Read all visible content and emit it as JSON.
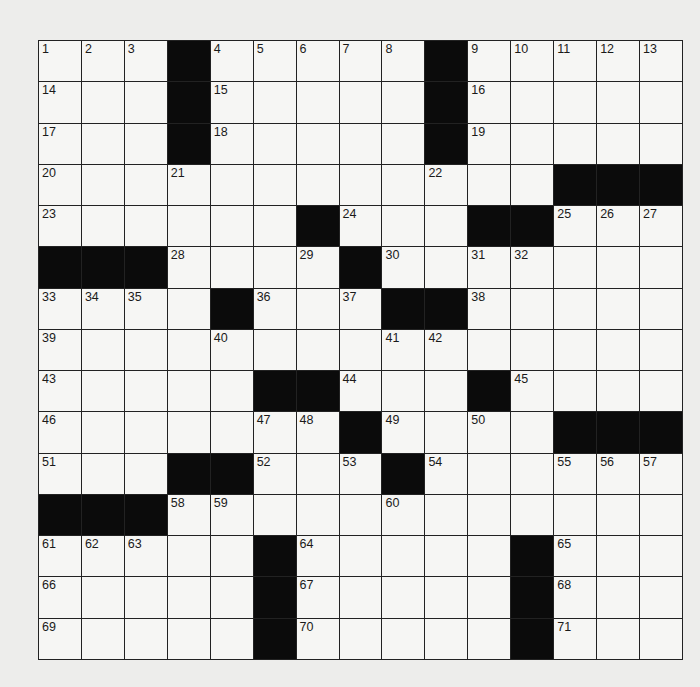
{
  "puzzle": {
    "size": 15,
    "rows": [
      "...#.....#.....",
      "...#.....#.....",
      "...#.....#.....",
      "............###",
      "......#...##...",
      "###....#.......",
      "....#...##.....",
      "...............",
      ".....##...#....",
      ".......#....###",
      "...##...#......",
      "###............",
      ".....#.....#...",
      ".....#.....#...",
      ".....#.....#..."
    ],
    "numbers": [
      {
        "r": 0,
        "c": 0,
        "n": "1"
      },
      {
        "r": 0,
        "c": 1,
        "n": "2"
      },
      {
        "r": 0,
        "c": 2,
        "n": "3"
      },
      {
        "r": 0,
        "c": 4,
        "n": "4"
      },
      {
        "r": 0,
        "c": 5,
        "n": "5"
      },
      {
        "r": 0,
        "c": 6,
        "n": "6"
      },
      {
        "r": 0,
        "c": 7,
        "n": "7"
      },
      {
        "r": 0,
        "c": 8,
        "n": "8"
      },
      {
        "r": 0,
        "c": 10,
        "n": "9"
      },
      {
        "r": 0,
        "c": 11,
        "n": "10"
      },
      {
        "r": 0,
        "c": 12,
        "n": "11"
      },
      {
        "r": 0,
        "c": 13,
        "n": "12"
      },
      {
        "r": 0,
        "c": 14,
        "n": "13"
      },
      {
        "r": 1,
        "c": 0,
        "n": "14"
      },
      {
        "r": 1,
        "c": 4,
        "n": "15"
      },
      {
        "r": 1,
        "c": 10,
        "n": "16"
      },
      {
        "r": 2,
        "c": 0,
        "n": "17"
      },
      {
        "r": 2,
        "c": 4,
        "n": "18"
      },
      {
        "r": 2,
        "c": 10,
        "n": "19"
      },
      {
        "r": 3,
        "c": 0,
        "n": "20"
      },
      {
        "r": 3,
        "c": 3,
        "n": "21"
      },
      {
        "r": 3,
        "c": 9,
        "n": "22"
      },
      {
        "r": 4,
        "c": 0,
        "n": "23"
      },
      {
        "r": 4,
        "c": 7,
        "n": "24"
      },
      {
        "r": 4,
        "c": 12,
        "n": "25"
      },
      {
        "r": 4,
        "c": 13,
        "n": "26"
      },
      {
        "r": 4,
        "c": 14,
        "n": "27"
      },
      {
        "r": 5,
        "c": 3,
        "n": "28"
      },
      {
        "r": 5,
        "c": 6,
        "n": "29"
      },
      {
        "r": 5,
        "c": 8,
        "n": "30"
      },
      {
        "r": 5,
        "c": 10,
        "n": "31"
      },
      {
        "r": 5,
        "c": 11,
        "n": "32"
      },
      {
        "r": 6,
        "c": 0,
        "n": "33"
      },
      {
        "r": 6,
        "c": 1,
        "n": "34"
      },
      {
        "r": 6,
        "c": 2,
        "n": "35"
      },
      {
        "r": 6,
        "c": 5,
        "n": "36"
      },
      {
        "r": 6,
        "c": 7,
        "n": "37"
      },
      {
        "r": 6,
        "c": 10,
        "n": "38"
      },
      {
        "r": 7,
        "c": 0,
        "n": "39"
      },
      {
        "r": 7,
        "c": 4,
        "n": "40"
      },
      {
        "r": 7,
        "c": 8,
        "n": "41"
      },
      {
        "r": 7,
        "c": 9,
        "n": "42"
      },
      {
        "r": 8,
        "c": 0,
        "n": "43"
      },
      {
        "r": 8,
        "c": 7,
        "n": "44"
      },
      {
        "r": 8,
        "c": 11,
        "n": "45"
      },
      {
        "r": 9,
        "c": 0,
        "n": "46"
      },
      {
        "r": 9,
        "c": 5,
        "n": "47"
      },
      {
        "r": 9,
        "c": 6,
        "n": "48"
      },
      {
        "r": 9,
        "c": 8,
        "n": "49"
      },
      {
        "r": 9,
        "c": 10,
        "n": "50"
      },
      {
        "r": 10,
        "c": 0,
        "n": "51"
      },
      {
        "r": 10,
        "c": 5,
        "n": "52"
      },
      {
        "r": 10,
        "c": 7,
        "n": "53"
      },
      {
        "r": 10,
        "c": 9,
        "n": "54"
      },
      {
        "r": 10,
        "c": 12,
        "n": "55"
      },
      {
        "r": 10,
        "c": 13,
        "n": "56"
      },
      {
        "r": 10,
        "c": 14,
        "n": "57"
      },
      {
        "r": 11,
        "c": 3,
        "n": "58"
      },
      {
        "r": 11,
        "c": 4,
        "n": "59"
      },
      {
        "r": 11,
        "c": 8,
        "n": "60"
      },
      {
        "r": 12,
        "c": 0,
        "n": "61"
      },
      {
        "r": 12,
        "c": 1,
        "n": "62"
      },
      {
        "r": 12,
        "c": 2,
        "n": "63"
      },
      {
        "r": 12,
        "c": 6,
        "n": "64"
      },
      {
        "r": 12,
        "c": 12,
        "n": "65"
      },
      {
        "r": 13,
        "c": 0,
        "n": "66"
      },
      {
        "r": 13,
        "c": 6,
        "n": "67"
      },
      {
        "r": 13,
        "c": 12,
        "n": "68"
      },
      {
        "r": 14,
        "c": 0,
        "n": "69"
      },
      {
        "r": 14,
        "c": 6,
        "n": "70"
      },
      {
        "r": 14,
        "c": 12,
        "n": "71"
      }
    ]
  },
  "colors": {
    "background": "#ededeb",
    "cell": "#f6f6f4",
    "block": "#0b0b0b",
    "line": "#222222"
  }
}
